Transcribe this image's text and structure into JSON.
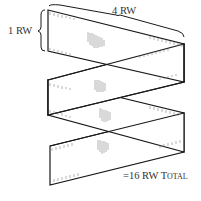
{
  "diagram": {
    "labels": {
      "width": "4 RW",
      "height": "1 RW",
      "total_prefix": "=16 RW T",
      "total_suffix": "OTAL"
    },
    "colors": {
      "stroke": "#1a1a1a",
      "hatch": "#555555",
      "text": "#333333",
      "background": "#ffffff"
    },
    "segments": 4
  }
}
